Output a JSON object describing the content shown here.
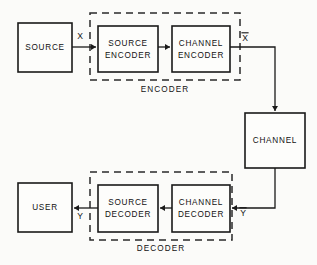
{
  "figure": {
    "kind": "block-diagram",
    "background_color": "#fbfbf9",
    "line_color": "#1a1a1a",
    "text_color": "#121212"
  },
  "blocks": [
    {
      "id": "source",
      "label_line1": "SOURCE",
      "label_line2": "",
      "x": 18,
      "y": 23,
      "w": 54,
      "h": 49
    },
    {
      "id": "source-encoder",
      "label_line1": "SOURCE",
      "label_line2": "ENCODER",
      "x": 98,
      "y": 26,
      "w": 60,
      "h": 46
    },
    {
      "id": "channel-encoder",
      "label_line1": "CHANNEL",
      "label_line2": "ENCODER",
      "x": 172,
      "y": 26,
      "w": 58,
      "h": 46
    },
    {
      "id": "channel",
      "label_line1": "CHANNEL",
      "label_line2": "",
      "x": 245,
      "y": 113,
      "w": 60,
      "h": 55
    },
    {
      "id": "channel-decoder",
      "label_line1": "CHANNEL",
      "label_line2": "DECODER",
      "x": 172,
      "y": 185,
      "w": 58,
      "h": 47
    },
    {
      "id": "source-decoder",
      "label_line1": "SOURCE",
      "label_line2": "DECODER",
      "x": 98,
      "y": 185,
      "w": 60,
      "h": 47
    },
    {
      "id": "user",
      "label_line1": "USER",
      "label_line2": "",
      "x": 18,
      "y": 183,
      "w": 54,
      "h": 49
    }
  ],
  "groups": [
    {
      "id": "encoder",
      "label": "ENCODER",
      "x": 90,
      "y": 13,
      "w": 150,
      "h": 67,
      "label_x": 165,
      "label_y": 90
    },
    {
      "id": "decoder",
      "label": "DECODER",
      "x": 90,
      "y": 172,
      "w": 142,
      "h": 68,
      "label_x": 161,
      "label_y": 249
    }
  ],
  "signals": [
    {
      "id": "x",
      "label": "X",
      "overbar": false,
      "x": 80,
      "y": 37
    },
    {
      "id": "x-bar",
      "label": "X",
      "overbar": true,
      "x": 245,
      "y": 39
    },
    {
      "id": "y-bar",
      "label": "Y",
      "overbar": true,
      "x": 243,
      "y": 214
    },
    {
      "id": "y",
      "label": "Y",
      "overbar": false,
      "x": 80,
      "y": 217
    }
  ],
  "wires": [
    {
      "id": "source-to-source-encoder",
      "points": "72,47 96,47",
      "arrow_at": "96,47",
      "arrow_dir": "right"
    },
    {
      "id": "source-encoder-to-channel-encoder",
      "points": "158,47 170,47",
      "arrow_at": "170,47",
      "arrow_dir": "right"
    },
    {
      "id": "channel-encoder-to-channel",
      "points": "230,47 275,47 275,111",
      "arrow_at": "275,111",
      "arrow_dir": "down"
    },
    {
      "id": "channel-to-channel-decoder",
      "points": "275,168 275,208 232,208",
      "arrow_at": "232,208",
      "arrow_dir": "left"
    },
    {
      "id": "channel-decoder-to-source-decoder",
      "points": "172,208 160,208",
      "arrow_at": "160,208",
      "arrow_dir": "left"
    },
    {
      "id": "source-decoder-to-user",
      "points": "98,208 74,208",
      "arrow_at": "74,208",
      "arrow_dir": "left"
    }
  ]
}
